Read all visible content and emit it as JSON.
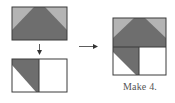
{
  "diagram": {
    "caption": "Make 4.",
    "colors": {
      "dark": "#6e6e6e",
      "light": "#b4b4b4",
      "white": "#ffffff",
      "outline": "#3a3a3a",
      "arrow": "#333333",
      "caption": "#555555"
    },
    "units": [
      {
        "name": "flying-geese-unit",
        "description": "Dark trapezoid with light corner triangles"
      },
      {
        "name": "half-square-unit",
        "description": "Dark/white half-square triangle beside a white square"
      },
      {
        "name": "combined-block",
        "description": "Flying geese unit sewn above the half-square unit"
      }
    ],
    "arrows": [
      {
        "name": "down-arrow",
        "direction": "down"
      },
      {
        "name": "right-arrow",
        "direction": "right"
      }
    ]
  }
}
